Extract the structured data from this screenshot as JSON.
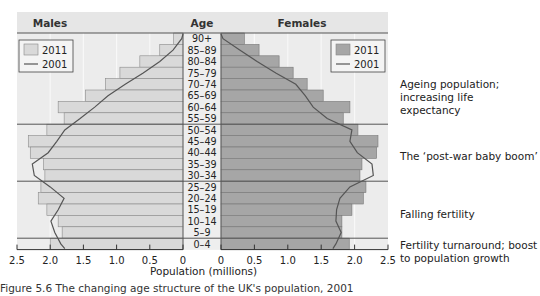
{
  "chart_data": {
    "type": "bar",
    "subtype": "population-pyramid",
    "header": {
      "left": "Males",
      "center": "Age",
      "right": "Females"
    },
    "categories": [
      "90+",
      "85–89",
      "80–84",
      "75–79",
      "70–74",
      "65–69",
      "60–64",
      "55–59",
      "50–54",
      "45–49",
      "40–44",
      "35–39",
      "30–34",
      "25–29",
      "20–24",
      "15–19",
      "10–14",
      "5–9",
      "0–4"
    ],
    "series": [
      {
        "name": "Males 2011",
        "kind": "bar",
        "values": [
          0.14,
          0.35,
          0.65,
          0.95,
          1.17,
          1.47,
          1.88,
          1.79,
          2.05,
          2.33,
          2.3,
          2.1,
          2.08,
          2.14,
          2.18,
          2.05,
          1.88,
          1.82,
          2.0
        ]
      },
      {
        "name": "Females 2011",
        "kind": "bar",
        "values": [
          0.35,
          0.57,
          0.87,
          1.08,
          1.29,
          1.53,
          1.93,
          1.83,
          2.05,
          2.35,
          2.33,
          2.11,
          2.08,
          2.17,
          2.13,
          1.96,
          1.81,
          1.81,
          1.92
        ]
      },
      {
        "name": "Males 2001",
        "kind": "line",
        "values": [
          0.02,
          0.15,
          0.35,
          0.6,
          0.87,
          1.13,
          1.33,
          1.55,
          1.78,
          1.9,
          2.03,
          2.27,
          2.24,
          2.0,
          1.79,
          1.88,
          1.99,
          1.93,
          1.84
        ]
      },
      {
        "name": "Females 2001",
        "kind": "line",
        "values": [
          0.03,
          0.28,
          0.54,
          0.82,
          1.12,
          1.26,
          1.38,
          1.59,
          1.96,
          1.93,
          2.04,
          2.26,
          2.28,
          1.93,
          1.78,
          1.73,
          1.72,
          1.8,
          1.72
        ]
      }
    ],
    "legend": {
      "entries": [
        "2011",
        "2001"
      ],
      "position": "top-inside-both-panels"
    },
    "xlabel": "Population (millions)",
    "ylabel": "Age",
    "xticks_left": [
      "2.5",
      "2.0",
      "1.5",
      "1.0",
      "0.5",
      "0"
    ],
    "xticks_right": [
      "0",
      "0.5",
      "1.0",
      "1.5",
      "2.0",
      "2.5"
    ],
    "xlim": [
      0,
      2.5
    ],
    "grid": "vertical at 0.5 intervals; horizontal separators at 55–59/50–54, 30–34/25–29, 5–9/0–4",
    "annotations": [
      {
        "text": "Ageing population; increasing life expectancy",
        "ages": "60+"
      },
      {
        "text": "The ‘post-war baby boom’",
        "ages": "35–54"
      },
      {
        "text": "Falling fertility",
        "ages": "5–24"
      },
      {
        "text": "Fertility turnaround; boost to population growth",
        "ages": "0–4"
      }
    ],
    "colors": {
      "male_bar": "#d9d9d9",
      "female_bar": "#a6a6a6",
      "line": "#555555",
      "panel_bg": "#ececec",
      "header_bg": "#e6e6e6"
    }
  },
  "annotations": {
    "ageing": [
      "Ageing population;",
      "increasing life",
      "expectancy"
    ],
    "boom": [
      "The ‘post-war baby boom’"
    ],
    "falling": [
      "Falling fertility"
    ],
    "turnaround": [
      "Fertility turnaround; boost",
      "to population growth"
    ]
  },
  "xlabel": "Population (millions)",
  "caption": "Figure 5.6 The changing age structure of the UK's population, 2001"
}
